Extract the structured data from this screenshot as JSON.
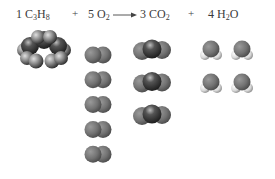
{
  "equation": {
    "reactant1": {
      "coef": "1",
      "formula": [
        "C",
        "3",
        "H",
        "8"
      ]
    },
    "plus1": "+",
    "reactant2": {
      "coef": "5",
      "formula": [
        "O",
        "2"
      ]
    },
    "arrow": "reaction-arrow",
    "product1": {
      "coef": "3",
      "formula": [
        "CO",
        "2"
      ]
    },
    "plus2": "+",
    "product2": {
      "coef": "4",
      "formula": [
        "H",
        "2",
        "O"
      ]
    }
  },
  "molecules": {
    "propane_count": 1,
    "oxygen_count": 5,
    "carbon_dioxide_count": 3,
    "water_count": 4
  },
  "colors": {
    "oxygen": "#777777",
    "carbon": "#3a3a3a",
    "hydrogen": "#e6e6e6"
  }
}
